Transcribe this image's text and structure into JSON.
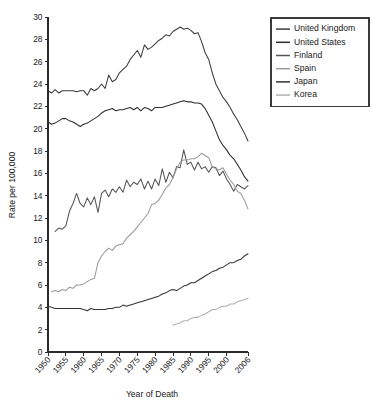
{
  "chart_data": {
    "type": "line",
    "title": "",
    "xlabel": "Year of Death",
    "ylabel": "Rate per 100,000",
    "xlim": [
      1950,
      2006
    ],
    "ylim": [
      0,
      30
    ],
    "grid": false,
    "legend_position": "top-right",
    "x_ticks": [
      "1950",
      "1955",
      "1960",
      "1965",
      "1970",
      "1975",
      "1980",
      "1985",
      "1990",
      "1995",
      "2000",
      "2006"
    ],
    "x_tick_values": [
      1950,
      1955,
      1960,
      1965,
      1970,
      1975,
      1980,
      1985,
      1990,
      1995,
      2000,
      2006
    ],
    "y_ticks": [
      "0",
      "2",
      "4",
      "6",
      "8",
      "10",
      "12",
      "14",
      "16",
      "18",
      "20",
      "22",
      "24",
      "26",
      "28",
      "30"
    ],
    "y_tick_values": [
      0,
      2,
      4,
      6,
      8,
      10,
      12,
      14,
      16,
      18,
      20,
      22,
      24,
      26,
      28,
      30
    ],
    "series": [
      {
        "name": "United Kingdom",
        "color": "#3c3c3c",
        "x": [
          1950,
          1951,
          1952,
          1953,
          1954,
          1955,
          1956,
          1957,
          1958,
          1959,
          1960,
          1961,
          1962,
          1963,
          1964,
          1965,
          1966,
          1967,
          1968,
          1969,
          1970,
          1971,
          1972,
          1973,
          1974,
          1975,
          1976,
          1977,
          1978,
          1979,
          1980,
          1981,
          1982,
          1983,
          1984,
          1985,
          1986,
          1987,
          1988,
          1989,
          1990,
          1991,
          1992,
          1993,
          1994,
          1995,
          1996,
          1997,
          1998,
          1999,
          2000,
          2001,
          2002,
          2003,
          2004,
          2005,
          2006
        ],
        "values": [
          23.4,
          23.2,
          23.5,
          23.2,
          23.4,
          23.4,
          23.4,
          23.4,
          23.3,
          23.4,
          23.4,
          23.0,
          23.6,
          23.4,
          23.6,
          24.0,
          23.6,
          24.8,
          24.2,
          24.4,
          25.0,
          25.3,
          25.6,
          26.2,
          26.6,
          27.0,
          26.4,
          27.5,
          27.1,
          27.3,
          27.6,
          27.9,
          28.1,
          28.4,
          28.3,
          28.7,
          28.9,
          29.1,
          28.9,
          29.0,
          28.8,
          28.5,
          28.6,
          27.8,
          26.8,
          26.2,
          25.0,
          24.0,
          23.4,
          22.8,
          22.4,
          21.9,
          21.3,
          20.8,
          20.2,
          19.6,
          18.9
        ]
      },
      {
        "name": "United States",
        "color": "#2e2e2e",
        "x": [
          1950,
          1951,
          1952,
          1953,
          1954,
          1955,
          1956,
          1957,
          1958,
          1959,
          1960,
          1961,
          1962,
          1963,
          1964,
          1965,
          1966,
          1967,
          1968,
          1969,
          1970,
          1971,
          1972,
          1973,
          1974,
          1975,
          1976,
          1977,
          1978,
          1979,
          1980,
          1981,
          1982,
          1983,
          1984,
          1985,
          1986,
          1987,
          1988,
          1989,
          1990,
          1991,
          1992,
          1993,
          1994,
          1995,
          1996,
          1997,
          1998,
          1999,
          2000,
          2001,
          2002,
          2003,
          2004,
          2005,
          2006
        ],
        "values": [
          20.6,
          20.4,
          20.5,
          20.7,
          20.9,
          20.9,
          20.7,
          20.6,
          20.4,
          20.2,
          20.4,
          20.5,
          20.7,
          20.9,
          21.1,
          21.4,
          21.6,
          21.7,
          21.8,
          21.6,
          21.7,
          21.7,
          21.8,
          21.9,
          21.7,
          21.9,
          21.6,
          21.9,
          21.8,
          21.6,
          21.9,
          21.9,
          21.9,
          22.0,
          22.1,
          22.2,
          22.3,
          22.4,
          22.5,
          22.4,
          22.4,
          22.3,
          22.3,
          22.2,
          21.8,
          21.2,
          20.6,
          19.8,
          19.0,
          18.5,
          18.1,
          17.6,
          17.3,
          16.8,
          16.3,
          15.7,
          15.3
        ]
      },
      {
        "name": "Finland",
        "color": "#555555",
        "x": [
          1952,
          1953,
          1954,
          1955,
          1956,
          1957,
          1958,
          1959,
          1960,
          1961,
          1962,
          1963,
          1964,
          1965,
          1966,
          1967,
          1968,
          1969,
          1970,
          1971,
          1972,
          1973,
          1974,
          1975,
          1976,
          1977,
          1978,
          1979,
          1980,
          1981,
          1982,
          1983,
          1984,
          1985,
          1986,
          1987,
          1988,
          1989,
          1990,
          1991,
          1992,
          1993,
          1994,
          1995,
          1996,
          1997,
          1998,
          1999,
          2000,
          2001,
          2002,
          2003,
          2004,
          2005,
          2006
        ],
        "values": [
          10.8,
          11.1,
          11.0,
          11.3,
          12.6,
          13.3,
          14.2,
          13.3,
          13.0,
          13.8,
          13.2,
          13.9,
          12.5,
          14.2,
          14.5,
          13.9,
          14.6,
          14.3,
          14.8,
          14.3,
          15.4,
          14.8,
          15.2,
          15.0,
          15.5,
          14.6,
          15.3,
          14.6,
          15.5,
          14.9,
          16.4,
          15.2,
          16.1,
          15.6,
          16.6,
          16.5,
          18.1,
          16.8,
          17.0,
          16.3,
          17.0,
          16.4,
          16.6,
          16.1,
          16.6,
          16.5,
          15.8,
          16.2,
          15.5,
          15.0,
          14.4,
          15.0,
          14.8,
          14.6,
          14.9
        ]
      },
      {
        "name": "Spain",
        "color": "#9a9a9a",
        "x": [
          1951,
          1952,
          1953,
          1954,
          1955,
          1956,
          1957,
          1958,
          1959,
          1960,
          1961,
          1962,
          1963,
          1964,
          1965,
          1966,
          1967,
          1968,
          1969,
          1970,
          1971,
          1972,
          1973,
          1974,
          1975,
          1976,
          1977,
          1978,
          1979,
          1980,
          1981,
          1982,
          1983,
          1984,
          1985,
          1986,
          1987,
          1988,
          1989,
          1990,
          1991,
          1992,
          1993,
          1994,
          1995,
          1996,
          1997,
          1998,
          1999,
          2000,
          2001,
          2002,
          2003,
          2004,
          2005,
          2006
        ],
        "values": [
          5.4,
          5.5,
          5.4,
          5.6,
          5.5,
          5.8,
          5.7,
          6.0,
          6.0,
          6.1,
          6.3,
          6.5,
          6.6,
          8.0,
          8.6,
          9.0,
          9.3,
          9.1,
          9.5,
          9.6,
          9.7,
          10.2,
          10.5,
          10.8,
          11.2,
          11.6,
          12.0,
          12.4,
          13.2,
          13.3,
          13.6,
          14.1,
          14.7,
          15.0,
          15.6,
          16.4,
          17.0,
          17.2,
          17.2,
          17.3,
          17.3,
          17.5,
          17.8,
          17.6,
          17.4,
          16.6,
          16.4,
          16.3,
          16.5,
          15.9,
          15.4,
          15.0,
          14.4,
          14.2,
          13.6,
          12.8
        ]
      },
      {
        "name": "Japan",
        "color": "#333333",
        "x": [
          1950,
          1951,
          1952,
          1953,
          1954,
          1955,
          1956,
          1957,
          1958,
          1959,
          1960,
          1961,
          1962,
          1963,
          1964,
          1965,
          1966,
          1967,
          1968,
          1969,
          1970,
          1971,
          1972,
          1973,
          1974,
          1975,
          1976,
          1977,
          1978,
          1979,
          1980,
          1981,
          1982,
          1983,
          1984,
          1985,
          1986,
          1987,
          1988,
          1989,
          1990,
          1991,
          1992,
          1993,
          1994,
          1995,
          1996,
          1997,
          1998,
          1999,
          2000,
          2001,
          2002,
          2003,
          2004,
          2005,
          2006
        ],
        "values": [
          4.1,
          4.0,
          3.9,
          3.9,
          3.9,
          3.9,
          3.9,
          3.9,
          3.9,
          3.9,
          3.8,
          3.7,
          3.9,
          3.8,
          3.8,
          3.8,
          3.8,
          3.9,
          3.9,
          4.0,
          4.0,
          4.2,
          4.1,
          4.2,
          4.3,
          4.4,
          4.5,
          4.6,
          4.7,
          4.8,
          4.9,
          5.0,
          5.2,
          5.3,
          5.5,
          5.6,
          5.5,
          5.7,
          5.9,
          6.0,
          6.2,
          6.2,
          6.4,
          6.6,
          6.8,
          7.0,
          7.2,
          7.3,
          7.5,
          7.6,
          7.8,
          8.0,
          8.0,
          8.2,
          8.3,
          8.6,
          8.8
        ]
      },
      {
        "name": "Korea",
        "color": "#b0b0b0",
        "x": [
          1985,
          1986,
          1987,
          1988,
          1989,
          1990,
          1991,
          1992,
          1993,
          1994,
          1995,
          1996,
          1997,
          1998,
          1999,
          2000,
          2001,
          2002,
          2003,
          2004,
          2005,
          2006
        ],
        "values": [
          2.4,
          2.5,
          2.6,
          2.8,
          2.8,
          3.0,
          3.1,
          3.1,
          3.3,
          3.4,
          3.6,
          3.8,
          3.8,
          4.0,
          4.1,
          4.1,
          4.3,
          4.3,
          4.5,
          4.6,
          4.7,
          4.8
        ]
      }
    ]
  },
  "legend": {
    "items": [
      {
        "label": "United Kingdom"
      },
      {
        "label": "United States"
      },
      {
        "label": "Finland"
      },
      {
        "label": "Spain"
      },
      {
        "label": "Japan"
      },
      {
        "label": "Korea"
      }
    ]
  }
}
